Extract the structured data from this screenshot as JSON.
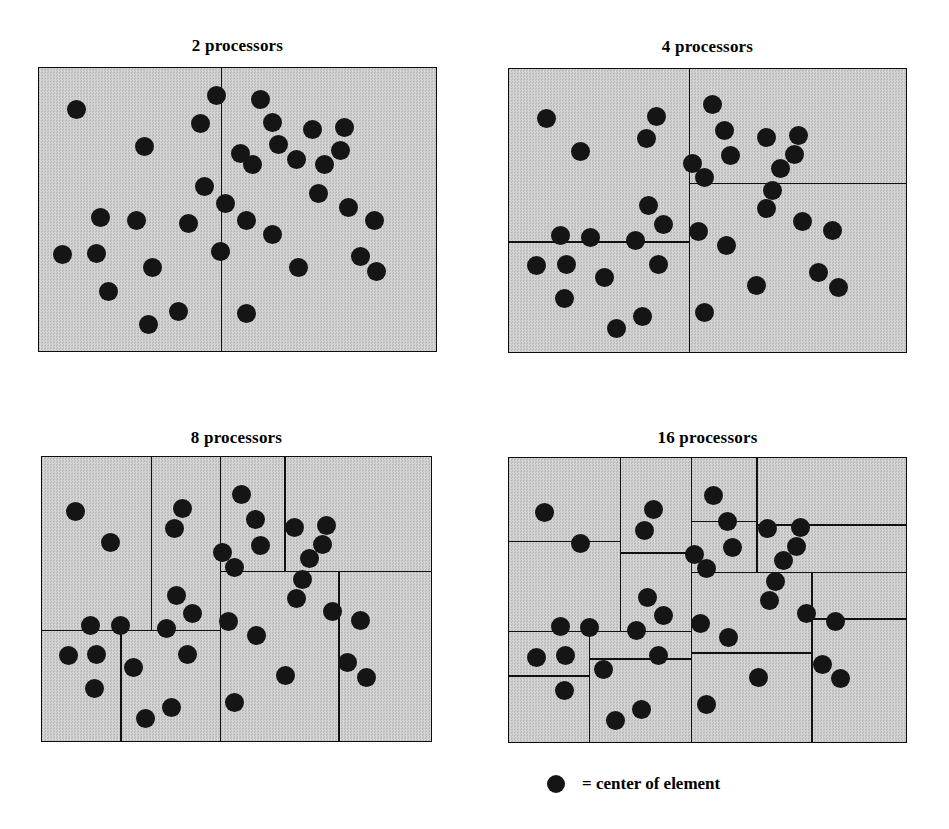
{
  "figure": {
    "background_color": "#ffffff",
    "panel_fill_color": "#c9c9c9",
    "line_color": "#111111",
    "dot_color": "#151515"
  },
  "legend": {
    "marker": "filled-circle",
    "text": "= center of element",
    "dot_x": 556,
    "dot_y": 787,
    "dot_r": 9,
    "text_x": 582,
    "text_y": 775
  },
  "chart_data": {
    "type": "scatter",
    "xlabel": "",
    "ylabel": "",
    "xlim": [
      0,
      1
    ],
    "ylim": [
      0,
      1
    ],
    "grid": false,
    "legend_position": "bottom-center",
    "legend_entries": [
      "= center of element"
    ],
    "note": "Each panel shows the same domain of element centers; lines are recursive-bisection cuts producing N subdomains (one per processor). Point and cut coordinates are normalized 0-1 within each panel box.",
    "panels": [
      {
        "title": "2 processors",
        "processors": 2,
        "box": {
          "x": 38,
          "y": 67,
          "w": 399,
          "h": 285
        },
        "title_y": 36,
        "n_points": 37,
        "cuts": [
          {
            "orient": "v",
            "pos": 0.455,
            "from": 0.0,
            "to": 1.0
          }
        ],
        "points": [
          [
            0.095,
            0.145
          ],
          [
            0.265,
            0.275
          ],
          [
            0.445,
            0.095
          ],
          [
            0.405,
            0.195
          ],
          [
            0.415,
            0.415
          ],
          [
            0.468,
            0.475
          ],
          [
            0.155,
            0.525
          ],
          [
            0.245,
            0.535
          ],
          [
            0.375,
            0.545
          ],
          [
            0.058,
            0.655
          ],
          [
            0.145,
            0.65
          ],
          [
            0.455,
            0.645
          ],
          [
            0.285,
            0.7
          ],
          [
            0.175,
            0.785
          ],
          [
            0.35,
            0.855
          ],
          [
            0.275,
            0.9
          ],
          [
            0.555,
            0.11
          ],
          [
            0.585,
            0.19
          ],
          [
            0.685,
            0.215
          ],
          [
            0.765,
            0.21
          ],
          [
            0.6,
            0.27
          ],
          [
            0.755,
            0.29
          ],
          [
            0.505,
            0.3
          ],
          [
            0.645,
            0.32
          ],
          [
            0.535,
            0.34
          ],
          [
            0.715,
            0.34
          ],
          [
            0.7,
            0.44
          ],
          [
            0.775,
            0.49
          ],
          [
            0.52,
            0.535
          ],
          [
            0.84,
            0.535
          ],
          [
            0.585,
            0.585
          ],
          [
            0.805,
            0.66
          ],
          [
            0.65,
            0.7
          ],
          [
            0.845,
            0.715
          ],
          [
            0.52,
            0.86
          ]
        ]
      },
      {
        "title": "4 processors",
        "processors": 4,
        "box": {
          "x": 508,
          "y": 68,
          "w": 399,
          "h": 285
        },
        "title_y": 37,
        "n_points": 37,
        "cuts": [
          {
            "orient": "v",
            "pos": 0.45,
            "from": 0.0,
            "to": 1.0
          },
          {
            "orient": "h",
            "pos": 0.605,
            "from": 0.0,
            "to": 0.45
          },
          {
            "orient": "h",
            "pos": 0.4,
            "from": 0.45,
            "to": 1.0
          }
        ],
        "points": [
          [
            0.095,
            0.175
          ],
          [
            0.18,
            0.29
          ],
          [
            0.37,
            0.165
          ],
          [
            0.345,
            0.245
          ],
          [
            0.35,
            0.48
          ],
          [
            0.388,
            0.545
          ],
          [
            0.13,
            0.585
          ],
          [
            0.205,
            0.59
          ],
          [
            0.318,
            0.6
          ],
          [
            0.068,
            0.69
          ],
          [
            0.145,
            0.685
          ],
          [
            0.375,
            0.685
          ],
          [
            0.24,
            0.73
          ],
          [
            0.14,
            0.805
          ],
          [
            0.335,
            0.87
          ],
          [
            0.27,
            0.91
          ],
          [
            0.51,
            0.125
          ],
          [
            0.54,
            0.215
          ],
          [
            0.645,
            0.24
          ],
          [
            0.725,
            0.235
          ],
          [
            0.555,
            0.305
          ],
          [
            0.715,
            0.3
          ],
          [
            0.46,
            0.33
          ],
          [
            0.68,
            0.35
          ],
          [
            0.49,
            0.38
          ],
          [
            0.66,
            0.425
          ],
          [
            0.645,
            0.49
          ],
          [
            0.735,
            0.535
          ],
          [
            0.475,
            0.57
          ],
          [
            0.81,
            0.565
          ],
          [
            0.545,
            0.62
          ],
          [
            0.775,
            0.715
          ],
          [
            0.62,
            0.76
          ],
          [
            0.825,
            0.765
          ],
          [
            0.49,
            0.855
          ]
        ]
      },
      {
        "title": "8 processors",
        "processors": 8,
        "box": {
          "x": 41,
          "y": 456,
          "w": 391,
          "h": 286
        },
        "title_y": 428,
        "n_points": 37,
        "cuts": [
          {
            "orient": "v",
            "pos": 0.455,
            "from": 0.0,
            "to": 1.0
          },
          {
            "orient": "h",
            "pos": 0.605,
            "from": 0.0,
            "to": 0.455
          },
          {
            "orient": "v",
            "pos": 0.278,
            "from": 0.0,
            "to": 0.605
          },
          {
            "orient": "v",
            "pos": 0.2,
            "from": 0.605,
            "to": 1.0
          },
          {
            "orient": "h",
            "pos": 0.398,
            "from": 0.455,
            "to": 1.0
          },
          {
            "orient": "v",
            "pos": 0.62,
            "from": 0.0,
            "to": 0.398
          },
          {
            "orient": "v",
            "pos": 0.758,
            "from": 0.398,
            "to": 1.0
          }
        ],
        "points": [
          [
            0.085,
            0.19
          ],
          [
            0.175,
            0.3
          ],
          [
            0.36,
            0.18
          ],
          [
            0.34,
            0.25
          ],
          [
            0.345,
            0.485
          ],
          [
            0.385,
            0.548
          ],
          [
            0.125,
            0.588
          ],
          [
            0.2,
            0.59
          ],
          [
            0.318,
            0.6
          ],
          [
            0.068,
            0.695
          ],
          [
            0.14,
            0.69
          ],
          [
            0.372,
            0.69
          ],
          [
            0.235,
            0.735
          ],
          [
            0.135,
            0.81
          ],
          [
            0.33,
            0.875
          ],
          [
            0.265,
            0.915
          ],
          [
            0.51,
            0.13
          ],
          [
            0.545,
            0.22
          ],
          [
            0.645,
            0.245
          ],
          [
            0.728,
            0.24
          ],
          [
            0.558,
            0.31
          ],
          [
            0.718,
            0.305
          ],
          [
            0.462,
            0.335
          ],
          [
            0.685,
            0.355
          ],
          [
            0.492,
            0.385
          ],
          [
            0.665,
            0.43
          ],
          [
            0.65,
            0.495
          ],
          [
            0.742,
            0.54
          ],
          [
            0.478,
            0.575
          ],
          [
            0.815,
            0.57
          ],
          [
            0.548,
            0.625
          ],
          [
            0.782,
            0.72
          ],
          [
            0.622,
            0.765
          ],
          [
            0.83,
            0.77
          ],
          [
            0.492,
            0.86
          ]
        ]
      },
      {
        "title": "16 processors",
        "processors": 16,
        "box": {
          "x": 508,
          "y": 457,
          "w": 399,
          "h": 286
        },
        "title_y": 428,
        "n_points": 37,
        "cuts": [
          {
            "orient": "v",
            "pos": 0.455,
            "from": 0.0,
            "to": 1.0
          },
          {
            "orient": "h",
            "pos": 0.605,
            "from": 0.0,
            "to": 0.455
          },
          {
            "orient": "v",
            "pos": 0.278,
            "from": 0.0,
            "to": 0.605
          },
          {
            "orient": "v",
            "pos": 0.2,
            "from": 0.605,
            "to": 1.0
          },
          {
            "orient": "h",
            "pos": 0.398,
            "from": 0.455,
            "to": 1.0
          },
          {
            "orient": "v",
            "pos": 0.62,
            "from": 0.0,
            "to": 0.398
          },
          {
            "orient": "v",
            "pos": 0.758,
            "from": 0.398,
            "to": 1.0
          },
          {
            "orient": "h",
            "pos": 0.29,
            "from": 0.0,
            "to": 0.278
          },
          {
            "orient": "h",
            "pos": 0.33,
            "from": 0.278,
            "to": 0.455
          },
          {
            "orient": "h",
            "pos": 0.76,
            "from": 0.0,
            "to": 0.2
          },
          {
            "orient": "h",
            "pos": 0.7,
            "from": 0.2,
            "to": 0.455
          },
          {
            "orient": "h",
            "pos": 0.22,
            "from": 0.455,
            "to": 0.62
          },
          {
            "orient": "h",
            "pos": 0.232,
            "from": 0.62,
            "to": 1.0
          },
          {
            "orient": "h",
            "pos": 0.68,
            "from": 0.455,
            "to": 0.758
          },
          {
            "orient": "h",
            "pos": 0.56,
            "from": 0.758,
            "to": 1.0
          }
        ],
        "points": [
          [
            0.09,
            0.19
          ],
          [
            0.18,
            0.3
          ],
          [
            0.362,
            0.18
          ],
          [
            0.34,
            0.252
          ],
          [
            0.348,
            0.488
          ],
          [
            0.388,
            0.55
          ],
          [
            0.128,
            0.59
          ],
          [
            0.202,
            0.592
          ],
          [
            0.32,
            0.602
          ],
          [
            0.07,
            0.698
          ],
          [
            0.142,
            0.692
          ],
          [
            0.375,
            0.692
          ],
          [
            0.238,
            0.738
          ],
          [
            0.138,
            0.812
          ],
          [
            0.332,
            0.878
          ],
          [
            0.268,
            0.918
          ],
          [
            0.512,
            0.132
          ],
          [
            0.548,
            0.222
          ],
          [
            0.648,
            0.248
          ],
          [
            0.73,
            0.242
          ],
          [
            0.56,
            0.312
          ],
          [
            0.72,
            0.308
          ],
          [
            0.465,
            0.338
          ],
          [
            0.688,
            0.358
          ],
          [
            0.495,
            0.388
          ],
          [
            0.668,
            0.432
          ],
          [
            0.652,
            0.498
          ],
          [
            0.745,
            0.542
          ],
          [
            0.48,
            0.578
          ],
          [
            0.818,
            0.572
          ],
          [
            0.55,
            0.628
          ],
          [
            0.785,
            0.722
          ],
          [
            0.625,
            0.768
          ],
          [
            0.832,
            0.772
          ],
          [
            0.495,
            0.862
          ]
        ]
      }
    ]
  }
}
